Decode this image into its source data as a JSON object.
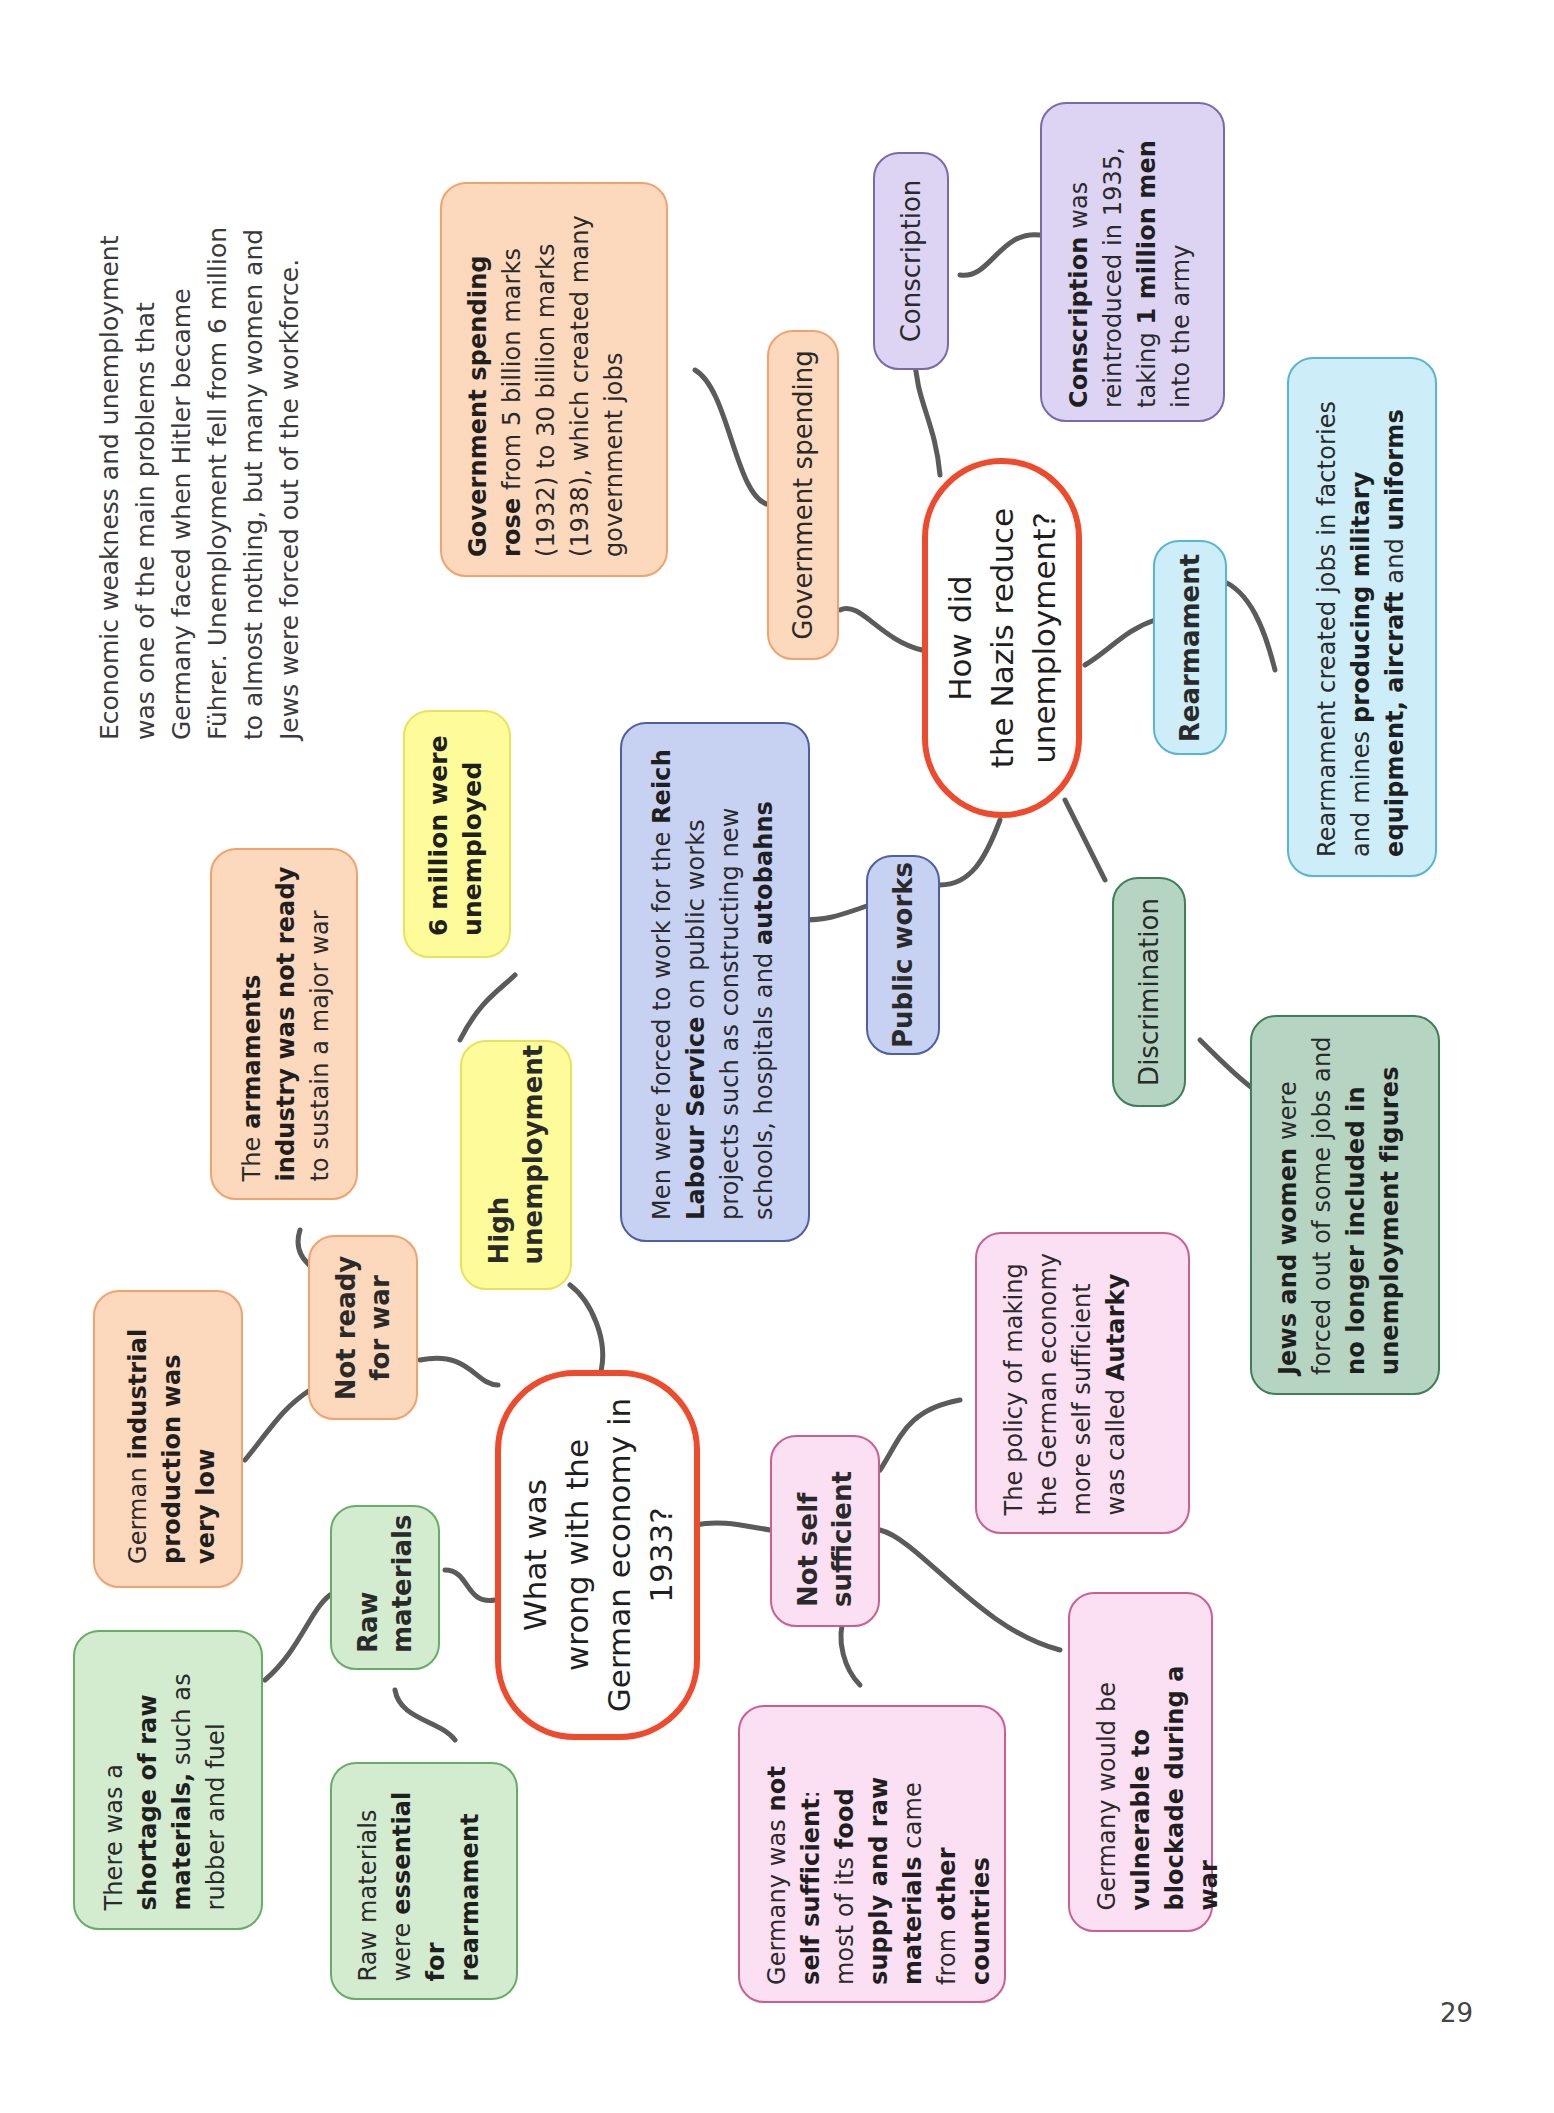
{
  "intro_text": {
    "lines": [
      "Economic weakness and unemployment",
      "was one of the main problems that",
      "Germany faced when Hitler became",
      "Führer.  Unemployment fell from 6 million",
      "to almost nothing, but many women and",
      "Jews were forced out of the workforce."
    ]
  },
  "map1": {
    "center": {
      "line1": "What was",
      "line2": "wrong with the",
      "line3": "German economy in",
      "line4": "1933?"
    },
    "branches": {
      "not_ready": {
        "label": "Not ready for war",
        "details": [
          {
            "pre": "The ",
            "bold1": "armaments industry was not ready",
            "post": " to sustain a major war"
          },
          {
            "pre": "German ",
            "bold1": "industrial production was very low",
            "post": ""
          }
        ]
      },
      "high_unemployment": {
        "label": "High unemployment",
        "detail": {
          "bold1": "6 million were unemployed"
        }
      },
      "raw_materials": {
        "label": "Raw materials",
        "details": [
          {
            "pre": "There was a ",
            "bold1": "shortage of raw materials,",
            "post": " such as rubber and fuel"
          },
          {
            "pre": "Raw materials were ",
            "bold1": "essential for rearmament",
            "post": ""
          }
        ]
      },
      "not_self_sufficient": {
        "label": "Not self sufficient",
        "details": [
          {
            "pre": "The policy of making the German economy more self sufficient was called ",
            "bold1": "Autarky",
            "post": ""
          },
          {
            "pre": "Germany was ",
            "bold1": "not self sufficient",
            "mid": ": most of its ",
            "bold2": "food supply and raw materials",
            "mid2": " came from ",
            "bold3": "other countries"
          },
          {
            "pre": "Germany would be ",
            "bold1": "vulnerable to blockade during a war",
            "post": ""
          }
        ]
      }
    }
  },
  "map2": {
    "center": {
      "line1": "How did",
      "line2": "the Nazis reduce",
      "line3": "unemployment?"
    },
    "branches": {
      "government_spending": {
        "label": "Government spending",
        "detail": {
          "bold1": "Government spending rose",
          "post": " from 5 billion marks (1932) to 30 billion marks (1938), which created many government jobs"
        }
      },
      "conscription": {
        "label": "Conscription",
        "detail": {
          "bold1": "Conscription",
          "mid": " was reintroduced in 1935, taking ",
          "bold2": "1 million men",
          "post": " into the army"
        }
      },
      "rearmament": {
        "label": "Rearmament",
        "detail": {
          "pre": "Rearmament created jobs in factories and mines ",
          "bold1": "producing military equipment, aircraft",
          "mid": " and ",
          "bold2": "uniforms"
        }
      },
      "public_works": {
        "label": "Public works",
        "detail": {
          "pre": "Men were forced to work for the ",
          "bold1": "Reich Labour Service",
          "mid": " on public works projects such as constructing new schools, hospitals and ",
          "bold2": "autobahns"
        }
      },
      "discrimination": {
        "label": "Discrimination",
        "detail": {
          "bold1": "Jews and women",
          "mid": " were forced out of some jobs and ",
          "bold2": "no longer included in unemployment figures"
        }
      }
    }
  },
  "colors": {
    "center_border": "#ef4a2b",
    "orange": "#fcd9bd",
    "yellow": "#fdfb9a",
    "green": "#d3ecd0",
    "pink": "#fbdff3",
    "blue": "#c7d1f2",
    "purple": "#ddd4f4",
    "cyan": "#cdeef8",
    "sage": "#b5d5c2",
    "connector": "#5b5b5b"
  },
  "page_number": "29"
}
